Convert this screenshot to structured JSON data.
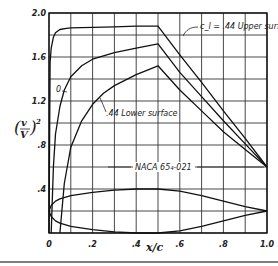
{
  "chart_data": {
    "type": "line",
    "title": "",
    "xlabel": "x/c",
    "ylabel": "(v/V)^2",
    "xlim": [
      0,
      1.0
    ],
    "ylim": [
      0,
      2.0
    ],
    "grid": true,
    "x_ticks": [
      "0",
      ".2",
      ".4",
      ".6",
      ".8",
      "1.0"
    ],
    "y_ticks": [
      ".4",
      ".8",
      "1.2",
      "1.6",
      "2.0"
    ],
    "annotations": {
      "upper": "c_l = .44 Upper surface",
      "zero": "0",
      "lower": ".44 Lower surface",
      "airfoil": "NACA 65₄-021"
    },
    "series": [
      {
        "name": "c_l = .44 Upper surface",
        "x": [
          0.0,
          0.005,
          0.01,
          0.02,
          0.03,
          0.05,
          0.08,
          0.1,
          0.2,
          0.3,
          0.4,
          0.5,
          0.6,
          0.7,
          0.8,
          0.9,
          1.0
        ],
        "y": [
          0.0,
          1.55,
          1.68,
          1.78,
          1.82,
          1.85,
          1.86,
          1.865,
          1.87,
          1.875,
          1.88,
          1.88,
          1.62,
          1.37,
          1.11,
          0.86,
          0.6
        ]
      },
      {
        "name": "0",
        "x": [
          0.01,
          0.02,
          0.03,
          0.05,
          0.07,
          0.1,
          0.15,
          0.2,
          0.3,
          0.4,
          0.5,
          0.6,
          0.7,
          0.8,
          0.9,
          1.0
        ],
        "y": [
          0.0,
          0.6,
          0.9,
          1.15,
          1.3,
          1.42,
          1.52,
          1.58,
          1.64,
          1.68,
          1.72,
          1.46,
          1.24,
          1.02,
          0.81,
          0.6
        ]
      },
      {
        "name": ".44 Lower surface",
        "x": [
          0.05,
          0.07,
          0.1,
          0.15,
          0.2,
          0.25,
          0.3,
          0.4,
          0.5,
          0.6,
          0.7,
          0.8,
          0.9,
          1.0
        ],
        "y": [
          0.0,
          0.45,
          0.78,
          1.02,
          1.17,
          1.27,
          1.34,
          1.44,
          1.52,
          1.3,
          1.11,
          0.92,
          0.76,
          0.6
        ]
      },
      {
        "name": "NACA 65₄-021 profile (upper)",
        "x": [
          0.0,
          0.01,
          0.03,
          0.05,
          0.1,
          0.2,
          0.3,
          0.4,
          0.5,
          0.6,
          0.7,
          0.8,
          0.9,
          1.0
        ],
        "y": [
          0.2,
          0.25,
          0.29,
          0.31,
          0.34,
          0.37,
          0.39,
          0.4,
          0.4,
          0.38,
          0.34,
          0.29,
          0.24,
          0.2
        ]
      },
      {
        "name": "NACA 65₄-021 profile (lower)",
        "x": [
          0.0,
          0.01,
          0.03,
          0.05,
          0.1,
          0.2,
          0.3,
          0.4,
          0.5,
          0.6,
          0.7,
          0.8,
          0.9,
          1.0
        ],
        "y": [
          0.2,
          0.15,
          0.11,
          0.09,
          0.06,
          0.03,
          0.01,
          0.0,
          0.0,
          0.02,
          0.06,
          0.11,
          0.16,
          0.2
        ]
      }
    ]
  }
}
